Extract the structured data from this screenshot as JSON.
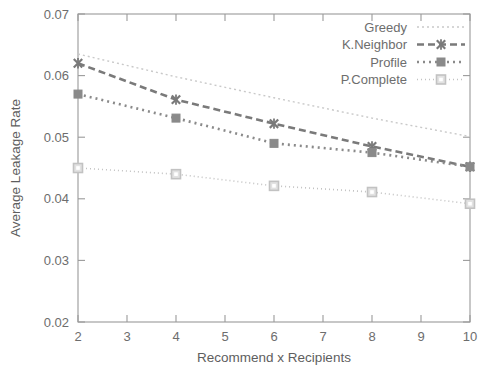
{
  "chart_data": {
    "type": "line",
    "title": "",
    "xlabel": "Recommend x Recipients",
    "ylabel": "Average Leakage Rate",
    "x": [
      2,
      4,
      6,
      8,
      10
    ],
    "xlim": [
      2,
      10
    ],
    "ylim": [
      0.02,
      0.07
    ],
    "xticks": [
      "2",
      "3",
      "4",
      "5",
      "6",
      "7",
      "8",
      "9",
      "10"
    ],
    "xtick_values": [
      2,
      3,
      4,
      5,
      6,
      7,
      8,
      9,
      10
    ],
    "yticks": [
      "0.02",
      "0.03",
      "0.04",
      "0.05",
      "0.06",
      "0.07"
    ],
    "ytick_values": [
      0.02,
      0.03,
      0.04,
      0.05,
      0.06,
      0.07
    ],
    "grid": false,
    "legend_position": "top-right",
    "series": [
      {
        "name": "Greedy",
        "values": [
          0.0635,
          0.0598,
          0.0564,
          0.0531,
          0.0501
        ],
        "color": "#c9c9c9",
        "dash": "2 3",
        "width": 1.4,
        "marker": "none"
      },
      {
        "name": "K.Neighbor",
        "values": [
          0.062,
          0.0561,
          0.0522,
          0.0485,
          0.0452
        ],
        "color": "#7a7a7a",
        "dash": "7 4",
        "width": 2.6,
        "marker": "cross"
      },
      {
        "name": "Profile",
        "values": [
          0.057,
          0.0531,
          0.049,
          0.0475,
          0.0452
        ],
        "color": "#8a8a8a",
        "dash": "2 4",
        "width": 2.6,
        "marker": "filled-square"
      },
      {
        "name": "P.Complete",
        "values": [
          0.045,
          0.044,
          0.0421,
          0.0411,
          0.0392
        ],
        "color": "#c2c2c2",
        "dash": "1 3",
        "width": 1.6,
        "marker": "open-square"
      }
    ]
  },
  "legend": {
    "entries": [
      {
        "label": "Greedy"
      },
      {
        "label": "K.Neighbor"
      },
      {
        "label": "Profile"
      },
      {
        "label": "P.Complete"
      }
    ]
  },
  "axes": {
    "x_title": "Recommend x Recipients",
    "y_title": "Average Leakage Rate"
  }
}
